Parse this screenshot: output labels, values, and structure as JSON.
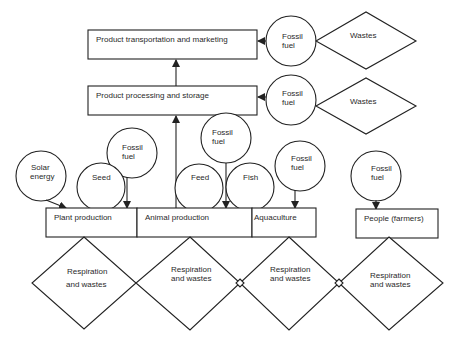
{
  "diagram": {
    "stages": {
      "transport": "Product transportation and marketing",
      "processing": "Product processing and storage"
    },
    "production": {
      "plant": "Plant production",
      "animal": "Animal production",
      "aquaculture": "Aquaculture",
      "people": "People (farmers)"
    },
    "inputs": {
      "solar_l1": "Solar",
      "solar_l2": "energy",
      "seed": "Seed",
      "feed": "Feed",
      "fish": "Fish",
      "fossil_l1": "Fossil",
      "fossil_l2": "fuel"
    },
    "outputs": {
      "wastes": "Wastes",
      "resp_l1": "Respiration",
      "resp_l2": "and wastes"
    }
  }
}
